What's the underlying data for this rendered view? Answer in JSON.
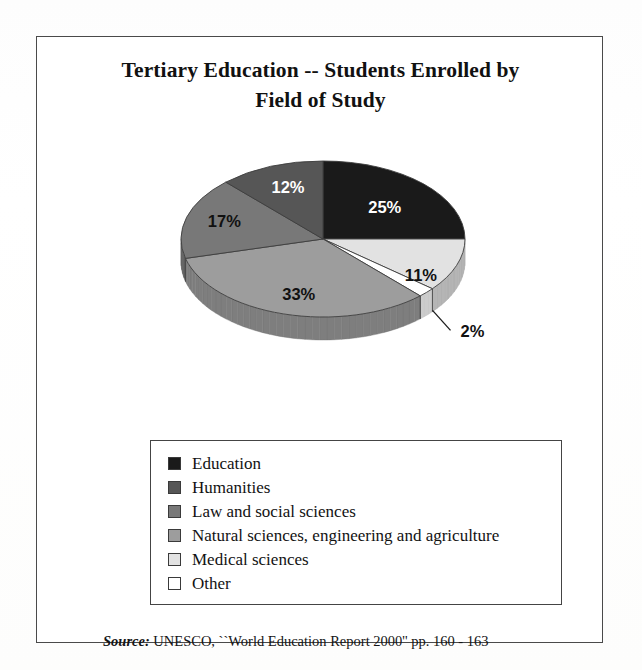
{
  "figure": {
    "title_line1": "Tertiary Education -- Students Enrolled by",
    "title_line2": "Field of Study",
    "source_label": "Source:",
    "source_text": " UNESCO, ``World Education Report 2000'' pp. 160 - 163"
  },
  "chart_data": {
    "type": "pie",
    "title": "Tertiary Education -- Students Enrolled by Field of Study",
    "subtitle": "",
    "xlabel": "",
    "ylabel": "",
    "unit": "percent",
    "start_angle_deg": 0,
    "direction": "clockwise",
    "three_d": true,
    "legend_position": "bottom",
    "grid": false,
    "categories": [
      "Education",
      "Medical sciences",
      "Other",
      "Natural sciences, engineering and agriculture",
      "Law and social sciences",
      "Humanities"
    ],
    "values": [
      25,
      11,
      2,
      33,
      17,
      12
    ],
    "data_labels": [
      "25%",
      "11%",
      "2%",
      "33%",
      "17%",
      "12%"
    ],
    "colors": [
      "#1a1a1a",
      "#e2e2e2",
      "#ffffff",
      "#9d9d9d",
      "#787878",
      "#565656"
    ],
    "slices": [
      {
        "label": "Education",
        "value": 25,
        "data_label": "25%",
        "color": "#1a1a1a",
        "label_color": "light"
      },
      {
        "label": "Medical sciences",
        "value": 11,
        "data_label": "11%",
        "color": "#e2e2e2",
        "label_color": "dark"
      },
      {
        "label": "Other",
        "value": 2,
        "data_label": "2%",
        "color": "#ffffff",
        "label_color": "dark",
        "callout": true
      },
      {
        "label": "Natural sciences, engineering and agriculture",
        "value": 33,
        "data_label": "33%",
        "color": "#9d9d9d",
        "label_color": "dark"
      },
      {
        "label": "Law and social sciences",
        "value": 17,
        "data_label": "17%",
        "color": "#787878",
        "label_color": "dark"
      },
      {
        "label": "Humanities",
        "value": 12,
        "data_label": "12%",
        "color": "#565656",
        "label_color": "light"
      }
    ]
  },
  "legend": {
    "items": [
      {
        "label": "Education",
        "color": "#1a1a1a"
      },
      {
        "label": "Humanities",
        "color": "#565656"
      },
      {
        "label": "Law and social sciences",
        "color": "#787878"
      },
      {
        "label": "Natural sciences, engineering and agriculture",
        "color": "#9d9d9d"
      },
      {
        "label": "Medical sciences",
        "color": "#e2e2e2"
      },
      {
        "label": "Other",
        "color": "#ffffff"
      }
    ]
  }
}
